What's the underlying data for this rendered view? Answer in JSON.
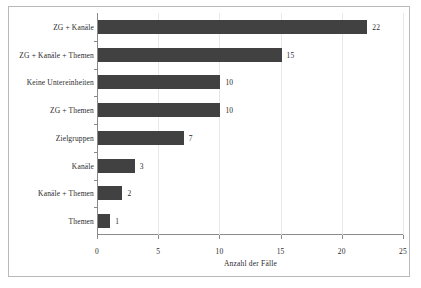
{
  "chart_data": {
    "type": "bar",
    "orientation": "horizontal",
    "title": "",
    "xlabel": "Anzahl der Fälle",
    "ylabel": "",
    "xlim": [
      0,
      25
    ],
    "xticks": [
      0,
      5,
      10,
      15,
      20,
      25
    ],
    "xticklabels": [
      "0",
      "5",
      "10",
      "15",
      "20",
      "25"
    ],
    "grid": true,
    "grid_axis": "x",
    "legend": false,
    "bar_color": "#414141",
    "categories": [
      "ZG + Kanäle",
      "ZG + Kanäle + Themen",
      "Keine Untereinheiten",
      "ZG + Themen",
      "Zielgruppen",
      "Kanäle",
      "Kanäle + Themen",
      "Themen"
    ],
    "values": [
      22,
      15,
      10,
      10,
      7,
      3,
      2,
      1
    ],
    "data_labels": [
      "22",
      "15",
      "10",
      "10",
      "7",
      "3",
      "2",
      "1"
    ]
  },
  "figure": {
    "frame_color": "#b9b9b9",
    "axis_color": "#8a8a8a",
    "gridline_color": "#e8e8e8",
    "background": "#ffffff"
  }
}
